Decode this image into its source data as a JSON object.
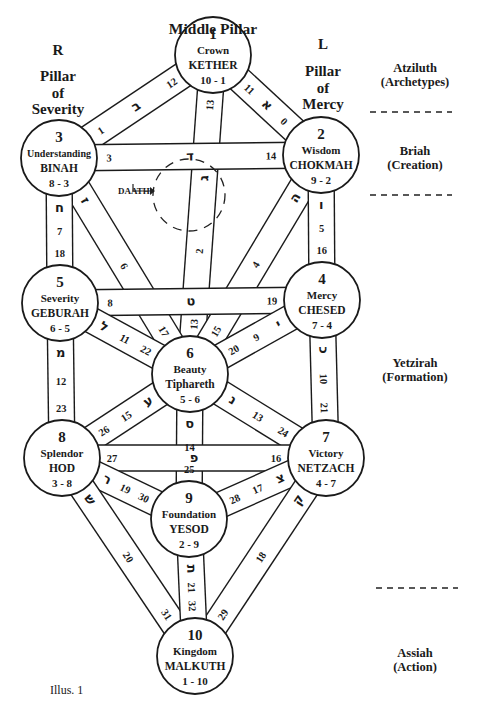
{
  "title": "Middle Pillar",
  "pillars": {
    "right": {
      "letter": "R",
      "line1": "Pillar",
      "line2": "of",
      "line3": "Severity"
    },
    "left": {
      "letter": "L",
      "line1": "Pillar",
      "line2": "of",
      "line3": "Mercy"
    },
    "middle": "Middle Pillar"
  },
  "worlds": [
    {
      "name": "Atziluth",
      "sub": "(Archetypes)"
    },
    {
      "name": "Briah",
      "sub": "(Creation)"
    },
    {
      "name": "Yetzirah",
      "sub": "(Formation)"
    },
    {
      "name": "Assiah",
      "sub": "(Action)"
    }
  ],
  "daath": "DAATH",
  "caption": "Illus. 1",
  "sephiroth": [
    {
      "num": "1",
      "title": "Crown",
      "name": "KETHER",
      "ratio": "10 - 1",
      "cx": 213,
      "cy": 55
    },
    {
      "num": "2",
      "title": "Wisdom",
      "name": "CHOKMAH",
      "ratio": "9 - 2",
      "cx": 321,
      "cy": 155
    },
    {
      "num": "3",
      "title": "Understanding",
      "name": "BINAH",
      "ratio": "8 - 3",
      "cx": 59,
      "cy": 158
    },
    {
      "num": "4",
      "title": "Mercy",
      "name": "CHESED",
      "ratio": "7 - 4",
      "cx": 322,
      "cy": 300
    },
    {
      "num": "5",
      "title": "Severity",
      "name": "GEBURAH",
      "ratio": "6 - 5",
      "cx": 60,
      "cy": 303
    },
    {
      "num": "6",
      "title": "Beauty",
      "name": "Tiphareth",
      "ratio": "5 - 6",
      "cx": 190,
      "cy": 374
    },
    {
      "num": "7",
      "title": "Victory",
      "name": "NETZACH",
      "ratio": "4 - 7",
      "cx": 326,
      "cy": 458
    },
    {
      "num": "8",
      "title": "Splendor",
      "name": "HOD",
      "ratio": "3 - 8",
      "cx": 62,
      "cy": 458
    },
    {
      "num": "9",
      "title": "Foundation",
      "name": "YESOD",
      "ratio": "2 - 9",
      "cx": 189,
      "cy": 519
    },
    {
      "num": "10",
      "title": "Kingdom",
      "name": "MALKUTH",
      "ratio": "1 - 10",
      "cx": 195,
      "cy": 656
    }
  ],
  "paths": [
    {
      "from": 0,
      "to": 1,
      "labels": [
        "11",
        "א",
        "0"
      ]
    },
    {
      "from": 0,
      "to": 2,
      "labels": [
        "12",
        "ב",
        "1"
      ]
    },
    {
      "from": 0,
      "to": 5,
      "labels": [
        "13",
        "ג",
        "2",
        "13"
      ]
    },
    {
      "from": 1,
      "to": 2,
      "labels": [
        "14",
        "ד",
        "3"
      ]
    },
    {
      "from": 1,
      "to": 5,
      "labels": [
        "ה",
        "4",
        "15"
      ]
    },
    {
      "from": 1,
      "to": 3,
      "labels": [
        "ו",
        "5",
        "16"
      ]
    },
    {
      "from": 2,
      "to": 5,
      "labels": [
        "ז",
        "6",
        "17"
      ]
    },
    {
      "from": 2,
      "to": 4,
      "labels": [
        "ח",
        "7",
        "18"
      ]
    },
    {
      "from": 3,
      "to": 4,
      "labels": [
        "19",
        "ט",
        "8"
      ]
    },
    {
      "from": 3,
      "to": 5,
      "labels": [
        "י",
        "9",
        "20"
      ]
    },
    {
      "from": 3,
      "to": 6,
      "labels": [
        "כ",
        "10",
        "21"
      ]
    },
    {
      "from": 4,
      "to": 5,
      "labels": [
        "ל",
        "11",
        "22"
      ]
    },
    {
      "from": 4,
      "to": 7,
      "labels": [
        "מ",
        "12",
        "23"
      ]
    },
    {
      "from": 5,
      "to": 6,
      "labels": [
        "נ",
        "13",
        "24"
      ]
    },
    {
      "from": 5,
      "to": 8,
      "labels": [
        "ס",
        "14",
        "25"
      ]
    },
    {
      "from": 5,
      "to": 7,
      "labels": [
        "ע",
        "15",
        "26"
      ]
    },
    {
      "from": 6,
      "to": 7,
      "labels": [
        "16",
        "פ",
        "27"
      ]
    },
    {
      "from": 6,
      "to": 8,
      "labels": [
        "צ",
        "17",
        "28"
      ]
    },
    {
      "from": 6,
      "to": 9,
      "labels": [
        "ק",
        "18",
        "29"
      ]
    },
    {
      "from": 7,
      "to": 8,
      "labels": [
        "ר",
        "19",
        "30"
      ]
    },
    {
      "from": 7,
      "to": 9,
      "labels": [
        "ש",
        "20",
        "31"
      ]
    },
    {
      "from": 8,
      "to": 9,
      "labels": [
        "ת",
        "21",
        "32"
      ]
    }
  ]
}
